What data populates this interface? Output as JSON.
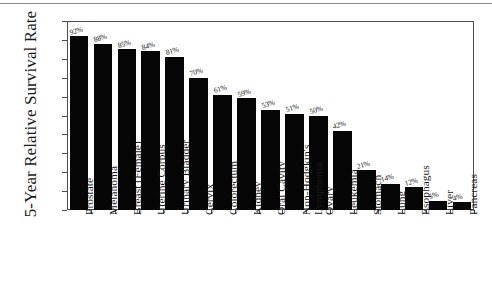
{
  "figure": {
    "y_axis_title": "5-Year Relative Survival Rate",
    "frame_color": "#4c4c4c",
    "bar_color": "#060606",
    "background": "#ffffff"
  },
  "chart_data": {
    "type": "bar",
    "title": "",
    "xlabel": "",
    "ylabel": "5-Year Relative Survival Rate",
    "ylim": [
      0,
      100
    ],
    "yticks": [
      0,
      10,
      20,
      30,
      40,
      50,
      60,
      70,
      80,
      90,
      100
    ],
    "ytick_labels": [
      "0",
      "10",
      "20",
      "30",
      "40",
      "50",
      "60",
      "70",
      "80",
      "90",
      "100"
    ],
    "grid": false,
    "legend": "none",
    "orientation": "vertical",
    "value_label_suffix": "%",
    "categories": [
      "Prostate",
      "Melanoma",
      "Breast (Female)",
      "Uterine Corpus",
      "Urinary Bladder",
      "Cervix",
      "Colorectum",
      "Kidney",
      "Oral Cavity",
      "Non-Hodgkin's Lymphoma",
      "Ovary",
      "Leukemia",
      "Stomach",
      "Lung",
      "Esophagus",
      "Liver",
      "Pancreas"
    ],
    "category_lines": [
      [
        "Prostate"
      ],
      [
        "Melanoma"
      ],
      [
        "Breast (Female)"
      ],
      [
        "Uterine Corpus"
      ],
      [
        "Urinary Bladder"
      ],
      [
        "Cervix"
      ],
      [
        "Colorectum"
      ],
      [
        "Kidney"
      ],
      [
        "Oral Cavity"
      ],
      [
        "Non-Hodgkin's",
        "Lymphoma"
      ],
      [
        "Ovary"
      ],
      [
        "Leukemia"
      ],
      [
        "Stomach"
      ],
      [
        "Lung"
      ],
      [
        "Esophagus"
      ],
      [
        "Liver"
      ],
      [
        "Pancreas"
      ]
    ],
    "values": [
      92,
      88,
      85,
      84,
      81,
      70,
      61,
      59,
      53,
      51,
      50,
      42,
      21,
      14,
      12,
      5,
      4
    ],
    "data_labels": [
      "92%",
      "88%",
      "85%",
      "84%",
      "81%",
      "70%",
      "61%",
      "59%",
      "53%",
      "51%",
      "50%",
      "42%",
      "21%",
      "14%",
      "12%",
      "5%",
      "4%"
    ]
  }
}
